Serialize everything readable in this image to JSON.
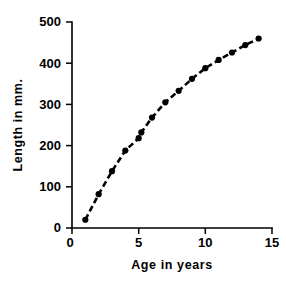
{
  "chart_data": {
    "type": "line",
    "title": "",
    "subtitle": "",
    "xlabel": "Age in years",
    "ylabel": "Length in mm.",
    "xlim": [
      0,
      15
    ],
    "ylim": [
      0,
      500
    ],
    "xticks": [
      0,
      5,
      10,
      15
    ],
    "yticks": [
      0,
      100,
      200,
      300,
      400,
      500
    ],
    "xtick_labels": [
      "0",
      "5",
      "10",
      "15"
    ],
    "ytick_labels": [
      "0",
      "100",
      "200",
      "300",
      "400",
      "500"
    ],
    "grid": false,
    "legend": null,
    "legend_position": "none",
    "annotations": [],
    "marker": "filled-circle",
    "linestyle": "dashed",
    "color": "#000000",
    "series": [
      {
        "name": "growth curve",
        "x": [
          1,
          2,
          3,
          4,
          5,
          5.2,
          6,
          7,
          8,
          9,
          10,
          11,
          12,
          13,
          14
        ],
        "y": [
          20,
          82,
          138,
          188,
          218,
          232,
          268,
          305,
          333,
          362,
          388,
          408,
          426,
          444,
          460
        ]
      }
    ]
  },
  "axes": {
    "y_title": "Length in mm.",
    "x_title": "Age in years"
  }
}
